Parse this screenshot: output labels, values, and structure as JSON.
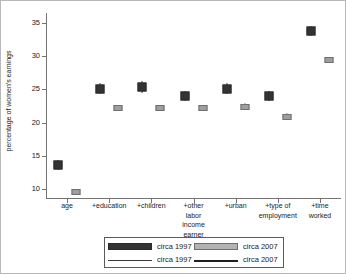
{
  "chart_data": {
    "type": "scatter",
    "title": "",
    "xlabel": "",
    "ylabel": "percentage of women's earnings",
    "ylim": [
      8.5,
      36.5
    ],
    "yticks": [
      10,
      15,
      20,
      25,
      30,
      35
    ],
    "grid": false,
    "legend_position": "bottom-center",
    "categories": [
      "age",
      "+education",
      "+children",
      "+other labor income earner",
      "+urban",
      "+type of employment",
      "+time worked"
    ],
    "category_lines": [
      [
        "age"
      ],
      [
        "+education"
      ],
      [
        "+children"
      ],
      [
        "+other",
        "labor",
        "income",
        "earner"
      ],
      [
        "+urban"
      ],
      [
        "+type of",
        "employment"
      ],
      [
        "+time",
        "worked"
      ]
    ],
    "series": [
      {
        "name": "circa 1997",
        "color": "#333333",
        "values": [
          13.6,
          25.1,
          25.4,
          24.0,
          25.1,
          24.0,
          33.8
        ],
        "error_low": [
          12.9,
          24.3,
          24.5,
          23.3,
          24.3,
          23.3,
          33.0
        ],
        "error_high": [
          14.3,
          25.9,
          26.3,
          24.7,
          25.9,
          24.7,
          34.6
        ]
      },
      {
        "name": "circa 2007",
        "color": "#9e9e9e",
        "values": [
          9.6,
          22.2,
          22.2,
          22.2,
          22.4,
          20.9,
          29.4
        ],
        "error_low": [
          9.2,
          21.7,
          21.7,
          21.7,
          21.9,
          20.4,
          28.9
        ],
        "error_high": [
          10.0,
          22.7,
          22.7,
          22.7,
          22.9,
          21.4,
          29.9
        ]
      }
    ]
  },
  "legend": {
    "rows": [
      [
        {
          "marker": "dark-swatch",
          "label": "circa 1997"
        },
        {
          "marker": "light-swatch",
          "label": "circa 2007"
        }
      ],
      [
        {
          "marker": "thin-line",
          "label": "circa 1997"
        },
        {
          "marker": "thick-line",
          "label": "circa 2007"
        }
      ]
    ]
  }
}
